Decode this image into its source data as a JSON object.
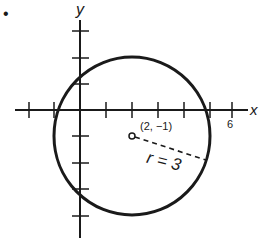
{
  "diagram": {
    "type": "circle-on-coordinate-plane",
    "axis_labels": {
      "x": "x",
      "y": "y"
    },
    "x_tick_label": "6",
    "center_label": "(2, −1)",
    "radius_label": "r = 3",
    "center": {
      "x": 2,
      "y": -1
    },
    "radius": 3,
    "x_ticks": [
      -2,
      -1,
      1,
      2,
      3,
      4,
      5,
      6
    ],
    "y_ticks": [
      3,
      2,
      1,
      -1,
      -2,
      -3,
      -4
    ],
    "colors": {
      "ink": "#1a1a1a",
      "background": "#ffffff"
    },
    "bullet": "•"
  }
}
